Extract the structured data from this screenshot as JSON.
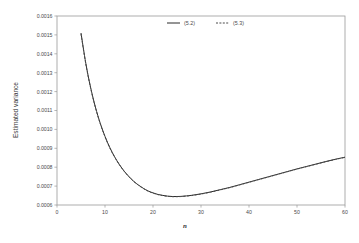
{
  "chart_data": {
    "type": "line",
    "title": "",
    "xlabel": "n",
    "ylabel": "Estimated variance",
    "xlim": [
      0,
      60
    ],
    "ylim": [
      0.0006,
      0.0016
    ],
    "xticks": [
      0,
      10,
      20,
      30,
      40,
      50,
      60
    ],
    "xtick_labels": [
      "0",
      "10",
      "20",
      "30",
      "40",
      "50",
      "60"
    ],
    "yticks": [
      0.0006,
      0.0007,
      0.0008,
      0.0009,
      0.001,
      0.0011,
      0.0012,
      0.0013,
      0.0014,
      0.0015,
      0.0016
    ],
    "ytick_labels": [
      "0.0006",
      "0.0007",
      "0.0008",
      "0.0009",
      "0.0010",
      "0.0011",
      "0.0012",
      "0.0013",
      "0.0014",
      "0.0015",
      "0.0016"
    ],
    "grid": false,
    "legend_position": "top-right",
    "series": [
      {
        "name": "(5.2)",
        "style": "solid",
        "color": "#2b2b2b",
        "x": [
          5,
          6,
          7,
          8,
          9,
          10,
          11,
          12,
          13,
          14,
          15,
          16,
          17,
          18,
          19,
          20,
          21,
          22,
          23,
          24,
          25,
          26,
          28,
          30,
          32,
          34,
          36,
          38,
          40,
          42,
          44,
          46,
          48,
          50,
          52,
          54,
          56,
          58,
          60
        ],
        "y": [
          0.00151,
          0.00135,
          0.001222,
          0.001118,
          0.001033,
          0.000963,
          0.000904,
          0.000855,
          0.000814,
          0.000779,
          0.00075,
          0.000725,
          0.000705,
          0.000688,
          0.000674,
          0.000664,
          0.000656,
          0.000651,
          0.000647,
          0.000645,
          0.000645,
          0.000646,
          0.000651,
          0.000659,
          0.000669,
          0.000681,
          0.000693,
          0.000707,
          0.000721,
          0.000735,
          0.000749,
          0.000763,
          0.000777,
          0.000791,
          0.000804,
          0.000817,
          0.00083,
          0.000842,
          0.000853
        ]
      },
      {
        "name": "(5.3)",
        "style": "dashed",
        "color": "#4a4a4a",
        "x": [
          5,
          6,
          7,
          8,
          9,
          10,
          11,
          12,
          13,
          14,
          15,
          16,
          17,
          18,
          19,
          20,
          21,
          22,
          23,
          24,
          25,
          26,
          28,
          30,
          32,
          34,
          36,
          38,
          40,
          42,
          44,
          46,
          48,
          50,
          52,
          54,
          56,
          58,
          60
        ],
        "y": [
          0.001505,
          0.001346,
          0.001219,
          0.001116,
          0.001031,
          0.000961,
          0.000902,
          0.000854,
          0.000813,
          0.000778,
          0.000749,
          0.000724,
          0.000704,
          0.000687,
          0.000673,
          0.000663,
          0.000655,
          0.00065,
          0.000646,
          0.000644,
          0.000644,
          0.000645,
          0.00065,
          0.000658,
          0.000668,
          0.00068,
          0.000692,
          0.000706,
          0.00072,
          0.000734,
          0.000748,
          0.000762,
          0.000776,
          0.00079,
          0.000803,
          0.000816,
          0.000829,
          0.000841,
          0.000852
        ]
      }
    ]
  },
  "legend": {
    "entries": [
      {
        "label": "(5.2)",
        "style": "solid"
      },
      {
        "label": "(5.3)",
        "style": "dashed"
      }
    ]
  }
}
